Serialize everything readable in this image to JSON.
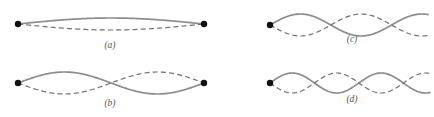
{
  "figure": {
    "background_color": "#ffffff",
    "solid_curve_color": "#8c8c8c",
    "dashed_curve_color": "#6e6e6e",
    "node_dot_color": "#111111",
    "label_color": "#555555"
  },
  "panels": [
    {
      "id": "a",
      "label": "(a)",
      "label_x": 110,
      "label_y": 48,
      "axis_y": 24,
      "x_start": 18,
      "x_end": 204,
      "amplitude": 6,
      "lobes": 1,
      "endpoint_dots": [
        {
          "x": 18,
          "y": 24,
          "r": 3.2
        },
        {
          "x": 204,
          "y": 24,
          "r": 3.2
        }
      ],
      "description": "fundamental mode, one lobe, fixed at both ends"
    },
    {
      "id": "b",
      "label": "(b)",
      "label_x": 110,
      "label_y": 106,
      "axis_y": 83,
      "x_start": 18,
      "x_end": 204,
      "amplitude": 11,
      "lobes": 2,
      "endpoint_dots": [
        {
          "x": 18,
          "y": 83,
          "r": 3.2
        },
        {
          "x": 204,
          "y": 83,
          "r": 3.2
        }
      ],
      "description": "second harmonic, two lobes, node at center"
    },
    {
      "id": "c",
      "label": "(c)",
      "label_x": 352,
      "label_y": 42,
      "axis_y": 25,
      "x_start": 270,
      "x_end": 428,
      "amplitude": 11,
      "lobes": 2.6,
      "endpoint_dots": [
        {
          "x": 270,
          "y": 25,
          "r": 3.2
        }
      ],
      "description": "wave fixed at left end, extends past right edge"
    },
    {
      "id": "d",
      "label": "(d)",
      "label_x": 352,
      "label_y": 102,
      "axis_y": 83,
      "x_start": 270,
      "x_end": 430,
      "amplitude": 10,
      "lobes": 3.6,
      "endpoint_dots": [
        {
          "x": 270,
          "y": 83,
          "r": 3.2
        }
      ],
      "description": "higher frequency wave fixed at left end, extends past right edge"
    }
  ]
}
